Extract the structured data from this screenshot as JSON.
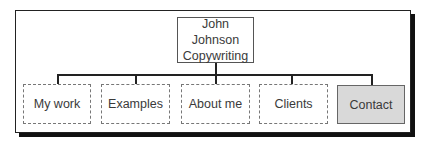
{
  "diagram": {
    "type": "site-map",
    "root": {
      "line1": "John Johnson",
      "line2": "Copywriting"
    },
    "children": [
      {
        "label": "My work",
        "highlighted": false
      },
      {
        "label": "Examples",
        "highlighted": false
      },
      {
        "label": "About me",
        "highlighted": false
      },
      {
        "label": "Clients",
        "highlighted": false
      },
      {
        "label": "Contact",
        "highlighted": true
      }
    ],
    "colors": {
      "highlight_fill": "#d9d9d9",
      "line": "#222222",
      "frame_shadow": "#111111"
    }
  }
}
